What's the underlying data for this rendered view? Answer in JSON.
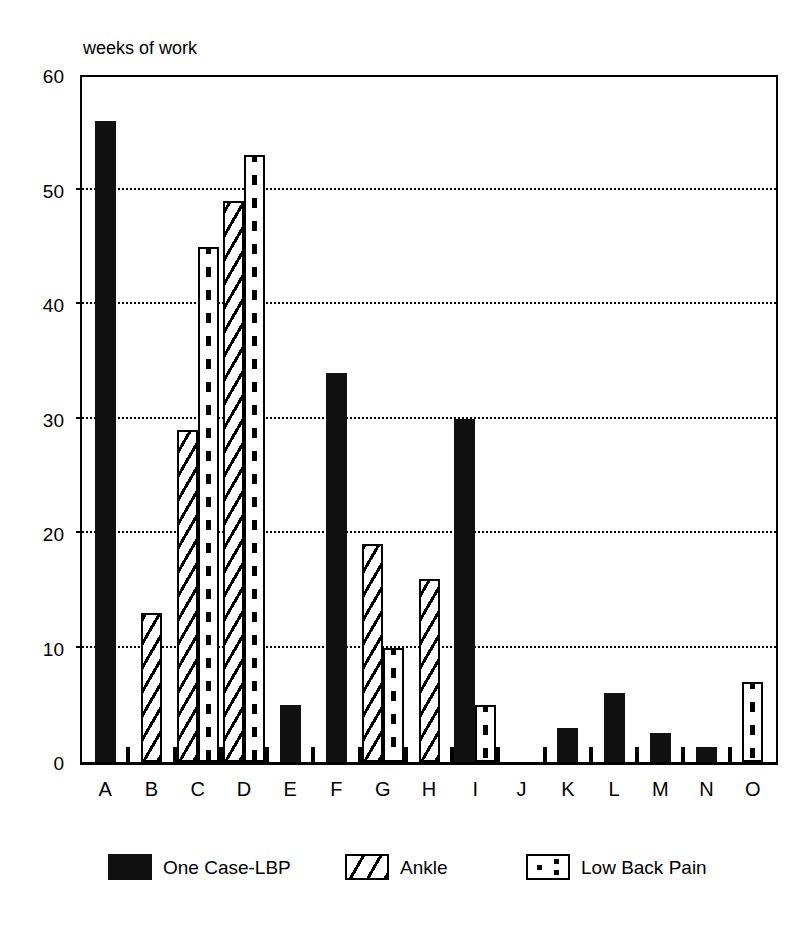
{
  "chart_data": {
    "type": "bar",
    "title": "",
    "subtitle": "",
    "xlabel": "",
    "ylabel": "weeks of work",
    "ylim": [
      0,
      60
    ],
    "yticks": [
      0,
      10,
      20,
      30,
      40,
      50,
      60
    ],
    "grid": true,
    "legend_position": "bottom",
    "categories": [
      "A",
      "B",
      "C",
      "D",
      "E",
      "F",
      "G",
      "H",
      "I",
      "J",
      "K",
      "L",
      "M",
      "N",
      "O"
    ],
    "series": [
      {
        "name": "One Case-LBP",
        "pattern": "solid",
        "color": "#111111",
        "values": [
          56,
          null,
          null,
          null,
          5,
          34,
          null,
          null,
          30,
          null,
          3,
          6,
          2.5,
          1.3,
          null
        ]
      },
      {
        "name": "Ankle",
        "pattern": "diagonal-hatch",
        "color": "#000000",
        "values": [
          null,
          13,
          29,
          49,
          null,
          null,
          19,
          16,
          null,
          null,
          null,
          null,
          null,
          null,
          null
        ]
      },
      {
        "name": "Low Back Pain",
        "pattern": "dotted",
        "color": "#000000",
        "values": [
          null,
          null,
          45,
          53,
          null,
          null,
          10,
          null,
          5,
          null,
          null,
          null,
          null,
          null,
          7
        ]
      }
    ]
  },
  "axis": {
    "y_title": "weeks of work",
    "y_tick_labels": [
      "0",
      "10",
      "20",
      "30",
      "40",
      "50",
      "60"
    ],
    "x_tick_labels": [
      "A",
      "B",
      "C",
      "D",
      "E",
      "F",
      "G",
      "H",
      "I",
      "J",
      "K",
      "L",
      "M",
      "N",
      "O"
    ]
  },
  "legend": {
    "items": [
      {
        "label": "One Case-LBP",
        "pattern": "solid"
      },
      {
        "label": "Ankle",
        "pattern": "diagonal-hatch"
      },
      {
        "label": "Low Back Pain",
        "pattern": "dotted"
      }
    ]
  }
}
